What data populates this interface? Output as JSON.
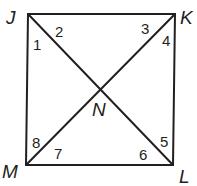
{
  "figure": {
    "type": "square with diagonals",
    "stroke_color": "#231f20",
    "background": "#ffffff",
    "vertices": {
      "J": {
        "label": "J",
        "x": 28,
        "y": 14
      },
      "K": {
        "label": "K",
        "x": 175,
        "y": 14
      },
      "L": {
        "label": "L",
        "x": 173,
        "y": 165
      },
      "M": {
        "label": "M",
        "x": 26,
        "y": 165
      }
    },
    "intersection": {
      "label": "N",
      "x": 101,
      "y": 90
    },
    "segments": [
      "JK",
      "KL",
      "LM",
      "MJ",
      "JL",
      "KM"
    ],
    "angles": [
      {
        "label": "1",
        "vertex": "J"
      },
      {
        "label": "2",
        "vertex": "J"
      },
      {
        "label": "3",
        "vertex": "K"
      },
      {
        "label": "4",
        "vertex": "K"
      },
      {
        "label": "5",
        "vertex": "L"
      },
      {
        "label": "6",
        "vertex": "L"
      },
      {
        "label": "7",
        "vertex": "M"
      },
      {
        "label": "8",
        "vertex": "M"
      }
    ]
  }
}
